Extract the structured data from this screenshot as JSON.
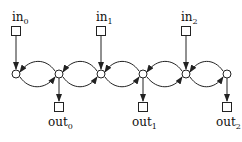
{
  "diagram": {
    "inputs": [
      {
        "label": "in",
        "sub": "0",
        "x": 16,
        "target_node": 0
      },
      {
        "label": "in",
        "sub": "1",
        "x": 101,
        "target_node": 2
      },
      {
        "label": "in",
        "sub": "2",
        "x": 186,
        "target_node": 4
      }
    ],
    "outputs": [
      {
        "label": "out",
        "sub": "0",
        "x": 59,
        "source_node": 1
      },
      {
        "label": "out",
        "sub": "1",
        "x": 143,
        "source_node": 3
      },
      {
        "label": "out",
        "sub": "2",
        "x": 227,
        "source_node": 5
      }
    ],
    "nodes": [
      {
        "id": 0,
        "x": 16,
        "y": 74
      },
      {
        "id": 1,
        "x": 59,
        "y": 74
      },
      {
        "id": 2,
        "x": 101,
        "y": 74
      },
      {
        "id": 3,
        "x": 143,
        "y": 74
      },
      {
        "id": 4,
        "x": 186,
        "y": 74
      },
      {
        "id": 5,
        "x": 227,
        "y": 74
      }
    ],
    "edge_style": "bidirectional arcs between adjacent nodes: top arc right-to-left, bottom arc left-to-right",
    "colors": {
      "stroke": "#222222",
      "background": "#ffffff"
    }
  }
}
